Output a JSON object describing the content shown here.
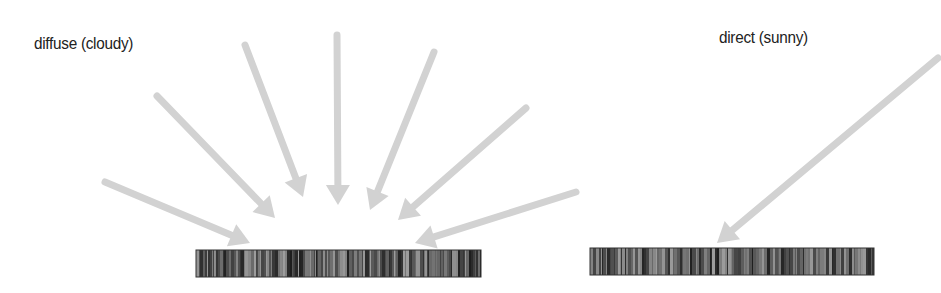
{
  "panels": {
    "diffuse": {
      "title": "diffuse (cloudy)",
      "title_pos": [
        34,
        34
      ],
      "surface": {
        "x": 196,
        "y": 250,
        "w": 285,
        "h": 27
      },
      "arrows": [
        {
          "from": [
            105,
            182
          ],
          "to": [
            250,
            243
          ]
        },
        {
          "from": [
            157,
            96
          ],
          "to": [
            275,
            218
          ]
        },
        {
          "from": [
            245,
            45
          ],
          "to": [
            303,
            197
          ]
        },
        {
          "from": [
            337,
            35
          ],
          "to": [
            338,
            205
          ]
        },
        {
          "from": [
            434,
            52
          ],
          "to": [
            370,
            210
          ]
        },
        {
          "from": [
            526,
            108
          ],
          "to": [
            398,
            220
          ]
        },
        {
          "from": [
            576,
            192
          ],
          "to": [
            415,
            243
          ]
        }
      ]
    },
    "direct": {
      "title": "direct (sunny)",
      "title_pos": [
        719,
        28
      ],
      "surface": {
        "x": 590,
        "y": 248,
        "w": 284,
        "h": 27
      },
      "arrows": [
        {
          "from": [
            938,
            58
          ],
          "to": [
            717,
            243
          ]
        }
      ]
    }
  },
  "colors": {
    "arrow": "#d2d2d2",
    "surface_dark": "#1e1e1e",
    "surface_light": "#8a8a8a",
    "text": "#222222"
  }
}
